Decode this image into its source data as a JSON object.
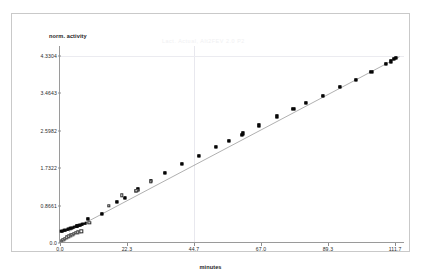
{
  "figure": {
    "title_faint": "Lact. Actual, Alt2FEV 2.0 P2"
  },
  "chart_data": {
    "type": "scatter",
    "title": "Lact. Actual, Alt2FEV 2.0 P2",
    "xlabel": "minutes",
    "ylabel": "norm. activity",
    "xlim": [
      0.0,
      115.0
    ],
    "ylim": [
      0.0,
      4.55
    ],
    "grid": true,
    "legend_position": "none",
    "xticks": [
      0.0,
      22.3,
      44.7,
      67.0,
      89.3,
      111.7
    ],
    "xtick_labels": [
      "0.0",
      "22.3",
      "44.7",
      "67.0",
      "89.3",
      "111.7"
    ],
    "yticks": [
      0.0,
      0.8661,
      1.7322,
      2.5982,
      3.4643,
      4.3304
    ],
    "ytick_labels": [
      "0.0",
      "0.8661",
      "1.7322",
      "2.5982",
      "3.4643",
      "4.3304"
    ],
    "gridlines_v": [
      44.7
    ],
    "gridlines_h": [
      4.3304
    ],
    "series": [
      {
        "name": "filled-markers",
        "marker": "filled-square",
        "color": "#121212",
        "points": [
          [
            5.6,
            0.392
          ],
          [
            9.3,
            0.563
          ],
          [
            14.0,
            0.678
          ],
          [
            19.0,
            0.944
          ],
          [
            21.6,
            1.049
          ],
          [
            25.4,
            1.211
          ],
          [
            25.9,
            1.238
          ],
          [
            30.2,
            1.428
          ],
          [
            34.9,
            1.625
          ],
          [
            40.6,
            1.823
          ],
          [
            46.3,
            2.012
          ],
          [
            52.1,
            2.218
          ],
          [
            56.2,
            2.366
          ],
          [
            60.5,
            2.505
          ],
          [
            60.9,
            2.53
          ],
          [
            66.4,
            2.718
          ],
          [
            72.4,
            2.925
          ],
          [
            77.8,
            3.093
          ],
          [
            82.0,
            3.234
          ],
          [
            87.5,
            3.4
          ],
          [
            93.2,
            3.608
          ],
          [
            98.5,
            3.775
          ],
          [
            103.8,
            3.948
          ],
          [
            108.7,
            4.13
          ],
          [
            110.2,
            4.196
          ],
          [
            111.3,
            4.245
          ],
          [
            112.1,
            4.268
          ]
        ]
      },
      {
        "name": "dense-cluster",
        "marker": "dense-filled",
        "color": "#0a0a0a",
        "comment": "thick black band of closely spaced points near the origin",
        "points": [
          [
            0.4,
            0.27
          ],
          [
            0.7,
            0.276
          ],
          [
            1.0,
            0.282
          ],
          [
            1.3,
            0.289
          ],
          [
            1.6,
            0.295
          ],
          [
            1.9,
            0.302
          ],
          [
            2.2,
            0.309
          ],
          [
            2.5,
            0.316
          ],
          [
            2.8,
            0.323
          ],
          [
            3.1,
            0.33
          ],
          [
            3.4,
            0.337
          ],
          [
            3.7,
            0.344
          ],
          [
            4.0,
            0.351
          ],
          [
            4.3,
            0.358
          ],
          [
            4.6,
            0.365
          ],
          [
            4.9,
            0.372
          ],
          [
            5.2,
            0.379
          ],
          [
            5.5,
            0.386
          ],
          [
            5.8,
            0.393
          ],
          [
            6.1,
            0.4
          ],
          [
            6.4,
            0.407
          ],
          [
            6.7,
            0.414
          ],
          [
            7.0,
            0.421
          ],
          [
            7.3,
            0.428
          ],
          [
            7.6,
            0.435
          ],
          [
            7.9,
            0.442
          ],
          [
            8.2,
            0.449
          ],
          [
            8.5,
            0.456
          ]
        ]
      },
      {
        "name": "open-markers",
        "marker": "open-square",
        "color": "#2a2a2a",
        "points": [
          [
            0.5,
            0.048
          ],
          [
            1.1,
            0.075
          ],
          [
            1.7,
            0.102
          ],
          [
            2.3,
            0.128
          ],
          [
            2.9,
            0.152
          ],
          [
            3.5,
            0.175
          ],
          [
            4.1,
            0.196
          ],
          [
            4.7,
            0.214
          ],
          [
            5.3,
            0.231
          ],
          [
            5.9,
            0.246
          ],
          [
            6.5,
            0.258
          ],
          [
            7.1,
            0.268
          ],
          [
            9.8,
            0.466
          ],
          [
            16.2,
            0.866
          ],
          [
            20.6,
            1.102
          ],
          [
            25.4,
            1.205
          ],
          [
            30.2,
            1.418
          ]
        ]
      }
    ],
    "trend_line": {
      "name": "regression-line",
      "color": "#7a7a7a",
      "from": [
        3.0,
        0.245
      ],
      "to": [
        113.5,
        4.3
      ]
    }
  }
}
